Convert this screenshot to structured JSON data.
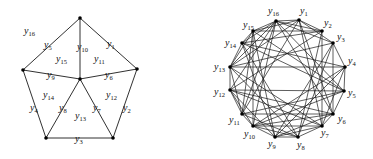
{
  "left_graph": {
    "nodes": [
      {
        "id": "top",
        "x": 80,
        "y": 18
      },
      {
        "id": "left",
        "x": 23,
        "y": 70
      },
      {
        "id": "right",
        "x": 137,
        "y": 69
      },
      {
        "id": "center",
        "x": 80,
        "y": 79
      },
      {
        "id": "bottom_left",
        "x": 46,
        "y": 138
      },
      {
        "id": "bottom_right",
        "x": 113,
        "y": 138
      }
    ],
    "edges": [
      {
        "from": "top",
        "to": "left",
        "label": "y",
        "sub": "5"
      },
      {
        "from": "top",
        "to": "right",
        "label": "y",
        "sub": "1"
      },
      {
        "from": "top",
        "to": "center",
        "label": "y",
        "sub": "10"
      },
      {
        "from": "left",
        "to": "center",
        "label": "y",
        "sub": "9"
      },
      {
        "from": "right",
        "to": "center",
        "label": "y",
        "sub": "6"
      },
      {
        "from": "left",
        "to": "bottom_left",
        "label": "y",
        "sub": "4"
      },
      {
        "from": "right",
        "to": "bottom_right",
        "label": "y",
        "sub": "2"
      },
      {
        "from": "center",
        "to": "bottom_left",
        "label": "y",
        "sub": "8"
      },
      {
        "from": "center",
        "to": "bottom_right",
        "label": "y",
        "sub": "7"
      },
      {
        "from": "bottom_left",
        "to": "bottom_right",
        "label": "y",
        "sub": "3"
      }
    ],
    "edge_labels": [
      {
        "text": "y",
        "sub": "5",
        "x": 44,
        "y": 48
      },
      {
        "text": "y",
        "sub": "1",
        "x": 107,
        "y": 47
      },
      {
        "text": "y",
        "sub": "10",
        "x": 77,
        "y": 50
      },
      {
        "text": "y",
        "sub": "9",
        "x": 47,
        "y": 78
      },
      {
        "text": "y",
        "sub": "6",
        "x": 105,
        "y": 78
      },
      {
        "text": "y",
        "sub": "4",
        "x": 30,
        "y": 111
      },
      {
        "text": "y",
        "sub": "2",
        "x": 123,
        "y": 111
      },
      {
        "text": "y",
        "sub": "8",
        "x": 59,
        "y": 111
      },
      {
        "text": "y",
        "sub": "7",
        "x": 93,
        "y": 111
      },
      {
        "text": "y",
        "sub": "3",
        "x": 75,
        "y": 142
      }
    ],
    "face_labels": [
      {
        "text": "y",
        "sub": "16",
        "x": 24,
        "y": 34
      },
      {
        "text": "y",
        "sub": "15",
        "x": 56,
        "y": 62
      },
      {
        "text": "y",
        "sub": "11",
        "x": 94,
        "y": 62
      },
      {
        "text": "y",
        "sub": "14",
        "x": 43,
        "y": 98
      },
      {
        "text": "y",
        "sub": "12",
        "x": 106,
        "y": 98
      },
      {
        "text": "y",
        "sub": "13",
        "x": 75,
        "y": 119
      }
    ]
  },
  "right_graph": {
    "nodes": [
      {
        "id": "y1",
        "x": 299,
        "y": 20,
        "label": "y",
        "sub": "1",
        "lx": 300,
        "ly": 14
      },
      {
        "id": "y2",
        "x": 322,
        "y": 31,
        "label": "y",
        "sub": "2",
        "lx": 324,
        "ly": 26
      },
      {
        "id": "y3",
        "x": 333,
        "y": 43,
        "label": "y",
        "sub": "3",
        "lx": 337,
        "ly": 40
      },
      {
        "id": "y4",
        "x": 345,
        "y": 67,
        "label": "y",
        "sub": "4",
        "lx": 348,
        "ly": 64
      },
      {
        "id": "y5",
        "x": 344,
        "y": 91,
        "label": "y",
        "sub": "5",
        "lx": 348,
        "ly": 96
      },
      {
        "id": "y6",
        "x": 333,
        "y": 114,
        "label": "y",
        "sub": "6",
        "lx": 338,
        "ly": 122
      },
      {
        "id": "y7",
        "x": 322,
        "y": 126,
        "label": "y",
        "sub": "7",
        "lx": 321,
        "ly": 136
      },
      {
        "id": "y8",
        "x": 298,
        "y": 137,
        "label": "y",
        "sub": "8",
        "lx": 297,
        "ly": 148
      },
      {
        "id": "y9",
        "x": 275,
        "y": 137,
        "label": "y",
        "sub": "9",
        "lx": 268,
        "ly": 147
      },
      {
        "id": "y10",
        "x": 253,
        "y": 126,
        "label": "y",
        "sub": "10",
        "lx": 244,
        "ly": 137
      },
      {
        "id": "y11",
        "x": 242,
        "y": 114,
        "label": "y",
        "sub": "11",
        "lx": 229,
        "ly": 123
      },
      {
        "id": "y12",
        "x": 230,
        "y": 90,
        "label": "y",
        "sub": "12",
        "lx": 214,
        "ly": 95
      },
      {
        "id": "y13",
        "x": 230,
        "y": 67,
        "label": "y",
        "sub": "13",
        "lx": 214,
        "ly": 70
      },
      {
        "id": "y14",
        "x": 242,
        "y": 43,
        "label": "y",
        "sub": "14",
        "lx": 225,
        "ly": 46
      },
      {
        "id": "y15",
        "x": 253,
        "y": 31,
        "label": "y",
        "sub": "15",
        "lx": 243,
        "ly": 28
      },
      {
        "id": "y16",
        "x": 276,
        "y": 21,
        "label": "y",
        "sub": "16",
        "lx": 268,
        "ly": 14
      }
    ],
    "edges": [
      [
        "y16",
        "y1"
      ],
      [
        "y16",
        "y15"
      ],
      [
        "y16",
        "y2"
      ],
      [
        "y16",
        "y3"
      ],
      [
        "y16",
        "y5"
      ],
      [
        "y16",
        "y6"
      ],
      [
        "y16",
        "y10"
      ],
      [
        "y16",
        "y11"
      ],
      [
        "y16",
        "y12"
      ],
      [
        "y16",
        "y14"
      ],
      [
        "y1",
        "y2"
      ],
      [
        "y1",
        "y3"
      ],
      [
        "y1",
        "y6"
      ],
      [
        "y1",
        "y7"
      ],
      [
        "y1",
        "y11"
      ],
      [
        "y1",
        "y13"
      ],
      [
        "y1",
        "y15"
      ],
      [
        "y2",
        "y7"
      ],
      [
        "y2",
        "y8"
      ],
      [
        "y2",
        "y12"
      ],
      [
        "y2",
        "y14"
      ],
      [
        "y2",
        "y15"
      ],
      [
        "y3",
        "y4"
      ],
      [
        "y3",
        "y8"
      ],
      [
        "y3",
        "y9"
      ],
      [
        "y3",
        "y13"
      ],
      [
        "y3",
        "y6"
      ],
      [
        "y4",
        "y5"
      ],
      [
        "y4",
        "y9"
      ],
      [
        "y4",
        "y10"
      ],
      [
        "y4",
        "y14"
      ],
      [
        "y4",
        "y7"
      ],
      [
        "y5",
        "y6"
      ],
      [
        "y5",
        "y10"
      ],
      [
        "y5",
        "y11"
      ],
      [
        "y5",
        "y15"
      ],
      [
        "y6",
        "y7"
      ],
      [
        "y6",
        "y11"
      ],
      [
        "y6",
        "y12"
      ],
      [
        "y6",
        "y10"
      ],
      [
        "y6",
        "y9"
      ],
      [
        "y7",
        "y8"
      ],
      [
        "y7",
        "y12"
      ],
      [
        "y7",
        "y13"
      ],
      [
        "y7",
        "y10"
      ],
      [
        "y7",
        "y9"
      ],
      [
        "y8",
        "y9"
      ],
      [
        "y8",
        "y13"
      ],
      [
        "y8",
        "y14"
      ],
      [
        "y8",
        "y10"
      ],
      [
        "y8",
        "y11"
      ],
      [
        "y9",
        "y10"
      ],
      [
        "y9",
        "y14"
      ],
      [
        "y9",
        "y15"
      ],
      [
        "y9",
        "y12"
      ],
      [
        "y10",
        "y15"
      ],
      [
        "y10",
        "y11"
      ],
      [
        "y10",
        "y12"
      ],
      [
        "y11",
        "y12"
      ],
      [
        "y11",
        "y15"
      ],
      [
        "y11",
        "y13"
      ],
      [
        "y12",
        "y13"
      ],
      [
        "y12",
        "y5"
      ],
      [
        "y13",
        "y14"
      ],
      [
        "y13",
        "y4"
      ],
      [
        "y13",
        "y16"
      ],
      [
        "y14",
        "y15"
      ],
      [
        "y14",
        "y5"
      ],
      [
        "y15",
        "y13"
      ]
    ]
  }
}
